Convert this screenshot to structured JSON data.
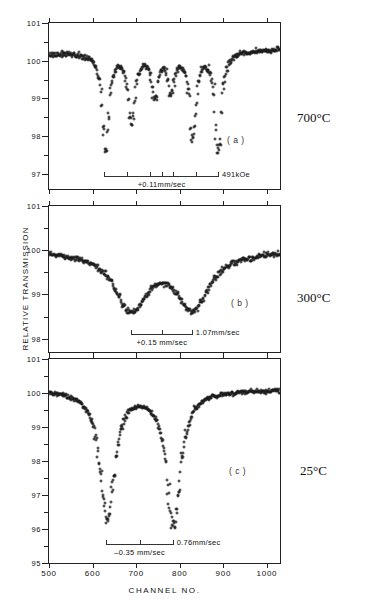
{
  "figure": {
    "y_axis_title": "RELATIVE TRANSMISSION",
    "x_axis_title": "CHANNEL  NO."
  },
  "panels": {
    "a": {
      "tag": "( a )",
      "temperature": "700°C",
      "y_labels": [
        "101",
        "100",
        "99",
        "98",
        "97"
      ],
      "scalebar_right_label": "491kOe",
      "scalebar_below_label": "+0.11mm/sec"
    },
    "b": {
      "tag": "( b )",
      "temperature": "300°C",
      "y_labels": [
        "101",
        "100",
        "99",
        "98",
        "101"
      ],
      "scalebar_right_label": "1.07mm/sec",
      "scalebar_below_label": "+0.15  mm/sec"
    },
    "c": {
      "tag": "( c )",
      "temperature": "25°C",
      "y_labels": [
        "101",
        "100",
        "99",
        "98",
        "97",
        "96",
        "95"
      ],
      "scalebar_right_label": "0.76mm/sec",
      "scalebar_below_label": "–0.35 mm/sec"
    }
  },
  "x_labels": [
    "500",
    "600",
    "700",
    "800",
    "900",
    "1000"
  ],
  "chart_data": {
    "type": "scatter",
    "xlabel": "CHANNEL  NO.",
    "ylabel": "RELATIVE TRANSMISSION",
    "xlim": [
      500,
      1030
    ],
    "xticks": [
      500,
      600,
      700,
      800,
      900,
      1000
    ],
    "grid": false,
    "legend": "none",
    "panels": [
      {
        "id": "a",
        "label": "( a )",
        "temperature": "700°C",
        "ylim": [
          96.6,
          101
        ],
        "yticks": [
          97,
          98,
          99,
          100,
          101
        ],
        "annotations": {
          "hyperfine_field": "491kOe",
          "isomer_shift": "+0.11mm/sec"
        },
        "pattern": "sextet",
        "line_positions_channel": [
          630,
          690,
          742,
          780,
          830,
          888
        ],
        "line_depths_percent": [
          97.6,
          98.4,
          99.1,
          99.2,
          98.0,
          97.6
        ],
        "baseline_percent": 100.2,
        "scalebar_span_channel": [
          627,
          890
        ]
      },
      {
        "id": "b",
        "label": "( b )",
        "temperature": "300°C",
        "ylim": [
          97.7,
          101
        ],
        "yticks": [
          98,
          99,
          100,
          101
        ],
        "annotations": {
          "splitting": "1.07mm/sec",
          "isomer_shift": "+0.15  mm/sec"
        },
        "pattern": "broad-doublet",
        "line_positions_channel": [
          688,
          830
        ],
        "line_depths_percent": [
          98.7,
          98.75
        ],
        "baseline_percent": 100.0,
        "scalebar_span_channel": [
          688,
          830
        ]
      },
      {
        "id": "c",
        "label": "( c )",
        "temperature": "25°C",
        "ylim": [
          95,
          101
        ],
        "yticks": [
          95,
          96,
          97,
          98,
          99,
          100,
          101
        ],
        "annotations": {
          "quadrupole_splitting": "0.76mm/sec",
          "isomer_shift": "–0.35 mm/sec"
        },
        "pattern": "doublet",
        "line_positions_channel": [
          634,
          786
        ],
        "line_depths_percent": [
          96.3,
          96.2
        ],
        "baseline_percent": 100.1,
        "scalebar_span_channel": [
          630,
          786
        ]
      }
    ]
  }
}
